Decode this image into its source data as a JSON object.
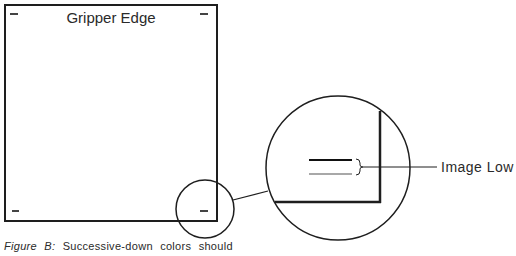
{
  "diagram": {
    "sheet_label": "Gripper Edge",
    "callout_label": "Image Low",
    "caption": {
      "figure": "Figure B:",
      "text": "Successive-down colors should"
    },
    "colors": {
      "line": "#1e1e1e",
      "registration_black": "#111111",
      "registration_gray": "#a8a8a8"
    }
  }
}
